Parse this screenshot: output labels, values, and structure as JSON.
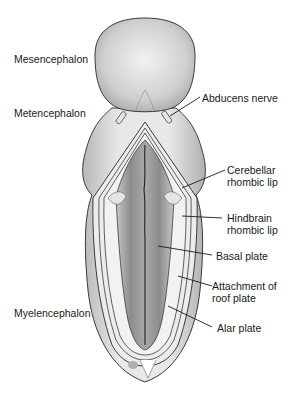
{
  "figure": {
    "left_labels": [
      {
        "id": "mesencephalon",
        "text": "Mesencephalon"
      },
      {
        "id": "metencephalon",
        "text": "Metencephalon"
      },
      {
        "id": "myelencephalon",
        "text": "Myelencephalon"
      }
    ],
    "right_labels": [
      {
        "id": "abducens-nerve",
        "lines": [
          "Abducens nerve"
        ]
      },
      {
        "id": "cerebellar-rhombic-lip",
        "lines": [
          "Cerebellar",
          "rhombic lip"
        ]
      },
      {
        "id": "hindbrain-rhombic-lip",
        "lines": [
          "Hindbrain",
          "rhombic lip"
        ]
      },
      {
        "id": "basal-plate",
        "lines": [
          "Basal plate"
        ]
      },
      {
        "id": "attachment-of-roof-plate",
        "lines": [
          "Attachment of",
          "roof plate"
        ]
      },
      {
        "id": "alar-plate",
        "lines": [
          "Alar plate"
        ]
      }
    ],
    "colors": {
      "outer_tissue": "#d9d9d9",
      "inner_floor": "#9a9a9a",
      "outline": "#3a3a3a",
      "leader_line": "#1a1a1a"
    }
  }
}
